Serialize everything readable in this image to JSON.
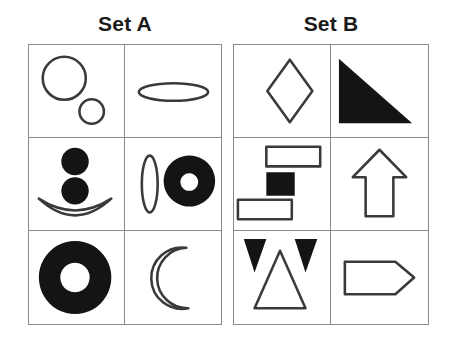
{
  "page": {
    "background_color": "#ffffff",
    "ink_color": "#141414",
    "outline_color": "#3a3a3a",
    "grid_line_color": "#8a8a8a"
  },
  "sets": [
    {
      "id": "set-a",
      "title": "Set A",
      "rows": 3,
      "columns": 2,
      "cells": [
        {
          "id": "a1",
          "position": "row1-col1",
          "description": "Large circle outline and small circle outline",
          "shapes": [
            {
              "name": "large-circle-outline",
              "type": "circle",
              "style": "outline"
            },
            {
              "name": "small-circle-outline",
              "type": "circle",
              "style": "outline"
            }
          ]
        },
        {
          "id": "a2",
          "position": "row1-col2",
          "description": "Flat horizontal ellipse outline",
          "shapes": [
            {
              "name": "horizontal-ellipse-outline",
              "type": "ellipse",
              "style": "outline"
            }
          ]
        },
        {
          "id": "a3",
          "position": "row2-col1",
          "description": "Two filled circles stacked above a crescent smile arc",
          "shapes": [
            {
              "name": "filled-circle-upper",
              "type": "circle",
              "style": "filled"
            },
            {
              "name": "filled-circle-lower",
              "type": "circle",
              "style": "filled"
            },
            {
              "name": "smile-arc-outline",
              "type": "crescent",
              "style": "outline"
            }
          ]
        },
        {
          "id": "a4",
          "position": "row2-col2",
          "description": "Narrow vertical ellipse outline beside a filled ring",
          "shapes": [
            {
              "name": "vertical-ellipse-outline",
              "type": "ellipse",
              "style": "outline"
            },
            {
              "name": "filled-ring",
              "type": "annulus",
              "style": "filled"
            }
          ]
        },
        {
          "id": "a5",
          "position": "row3-col1",
          "description": "Large filled ring (donut)",
          "shapes": [
            {
              "name": "large-filled-ring",
              "type": "annulus",
              "style": "filled"
            }
          ]
        },
        {
          "id": "a6",
          "position": "row3-col2",
          "description": "Crescent moon outline opening to the right",
          "shapes": [
            {
              "name": "crescent-moon-outline",
              "type": "crescent",
              "style": "outline"
            }
          ]
        }
      ]
    },
    {
      "id": "set-b",
      "title": "Set B",
      "rows": 3,
      "columns": 2,
      "cells": [
        {
          "id": "b1",
          "position": "row1-col1",
          "description": "Diamond (rhombus) outline",
          "shapes": [
            {
              "name": "diamond-outline",
              "type": "rhombus",
              "style": "outline"
            }
          ]
        },
        {
          "id": "b2",
          "position": "row1-col2",
          "description": "Filled right triangle with right angle at lower left",
          "shapes": [
            {
              "name": "filled-right-triangle",
              "type": "triangle",
              "style": "filled"
            }
          ]
        },
        {
          "id": "b3",
          "position": "row2-col1",
          "description": "Outlined rectangle, filled square, and outlined rectangle stacked diagonally",
          "shapes": [
            {
              "name": "rectangle-outline-top",
              "type": "rectangle",
              "style": "outline"
            },
            {
              "name": "filled-square-middle",
              "type": "square",
              "style": "filled"
            },
            {
              "name": "rectangle-outline-bottom",
              "type": "rectangle",
              "style": "outline"
            }
          ]
        },
        {
          "id": "b4",
          "position": "row2-col2",
          "description": "Upward pointing arrow outline",
          "shapes": [
            {
              "name": "up-arrow-outline",
              "type": "arrow",
              "style": "outline"
            }
          ]
        },
        {
          "id": "b5",
          "position": "row3-col1",
          "description": "Two small filled downward triangles flanking a large upward triangle outline",
          "shapes": [
            {
              "name": "filled-down-triangle-left",
              "type": "triangle",
              "style": "filled"
            },
            {
              "name": "up-triangle-outline",
              "type": "triangle",
              "style": "outline"
            },
            {
              "name": "filled-down-triangle-right",
              "type": "triangle",
              "style": "filled"
            }
          ]
        },
        {
          "id": "b6",
          "position": "row3-col2",
          "description": "Right pointing pentagon banner outline",
          "shapes": [
            {
              "name": "right-pointing-pentagon-outline",
              "type": "pentagon",
              "style": "outline"
            }
          ]
        }
      ]
    }
  ]
}
